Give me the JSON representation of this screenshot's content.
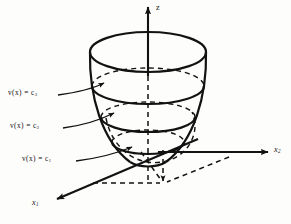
{
  "figure": {
    "type": "3d-line-diagram",
    "background_color": "#fdfdfc",
    "stroke_color": "#121212"
  },
  "axes": [
    {
      "id": "z",
      "label": "z",
      "subscript": "",
      "direction": "up",
      "style": "solid-with-arrow",
      "tip": [
        148,
        5
      ],
      "origin": [
        148,
        152
      ]
    },
    {
      "id": "x2",
      "label": "x",
      "subscript": "2",
      "direction": "right",
      "style": "solid-with-arrow",
      "tip": [
        270,
        152
      ],
      "origin": [
        160,
        152
      ]
    },
    {
      "id": "x1",
      "label": "x",
      "subscript": "1",
      "direction": "down-left",
      "style": "solid-with-arrow",
      "tip": [
        55,
        201
      ],
      "origin": [
        196,
        140
      ]
    }
  ],
  "contours": [
    {
      "id": "c1",
      "label_text": "v(x) = c",
      "subscript": "1",
      "value_name": "c1",
      "ellipse_center": [
        148,
        142
      ],
      "rx": 36,
      "ry": 12,
      "leader_from": [
        95,
        160
      ],
      "leader_to": [
        135,
        148
      ]
    },
    {
      "id": "c2",
      "label_text": "v(x) = c",
      "subscript": "2",
      "value_name": "c2",
      "ellipse_center": [
        148,
        117
      ],
      "rx": 47,
      "ry": 15,
      "leader_from": [
        83,
        127
      ],
      "leader_to": [
        116,
        114
      ]
    },
    {
      "id": "c3",
      "label_text": "v(x) = c",
      "subscript": "3",
      "value_name": "c3",
      "ellipse_center": [
        148,
        86
      ],
      "rx": 56,
      "ry": 18,
      "leader_from": [
        70,
        95
      ],
      "leader_to": [
        106,
        82
      ]
    }
  ],
  "surface": {
    "name": "paraboloid",
    "top_rim_center": [
      148,
      52
    ],
    "top_rim_rx": 58,
    "top_rim_ry": 20,
    "apex": [
      148,
      168
    ]
  },
  "projection": {
    "name": "base-plane-projection",
    "dashed": true,
    "point": [
      163,
      183
    ],
    "corner_left": [
      93,
      183
    ],
    "corner_up": [
      163,
      152
    ]
  }
}
